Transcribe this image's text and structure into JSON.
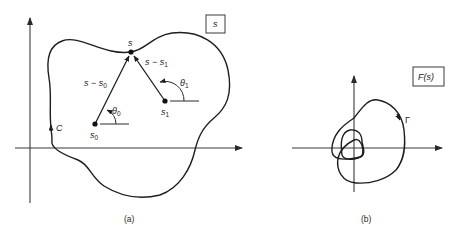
{
  "panel_a": {
    "caption": "(a)",
    "plane_label": "s",
    "contour_label": "C",
    "point_s": "s",
    "point_s0": "s",
    "point_s0_sub": "0",
    "point_s1": "s",
    "point_s1_sub": "1",
    "vector_s0": "s − s",
    "vector_s0_sub": "0",
    "vector_s1": "s − s",
    "vector_s1_sub": "1",
    "angle_0": "θ",
    "angle_0_sub": "0",
    "angle_1": "θ",
    "angle_1_sub": "1"
  },
  "panel_b": {
    "caption": "(b)",
    "plane_label": "F(s)",
    "contour_label": "Γ"
  }
}
